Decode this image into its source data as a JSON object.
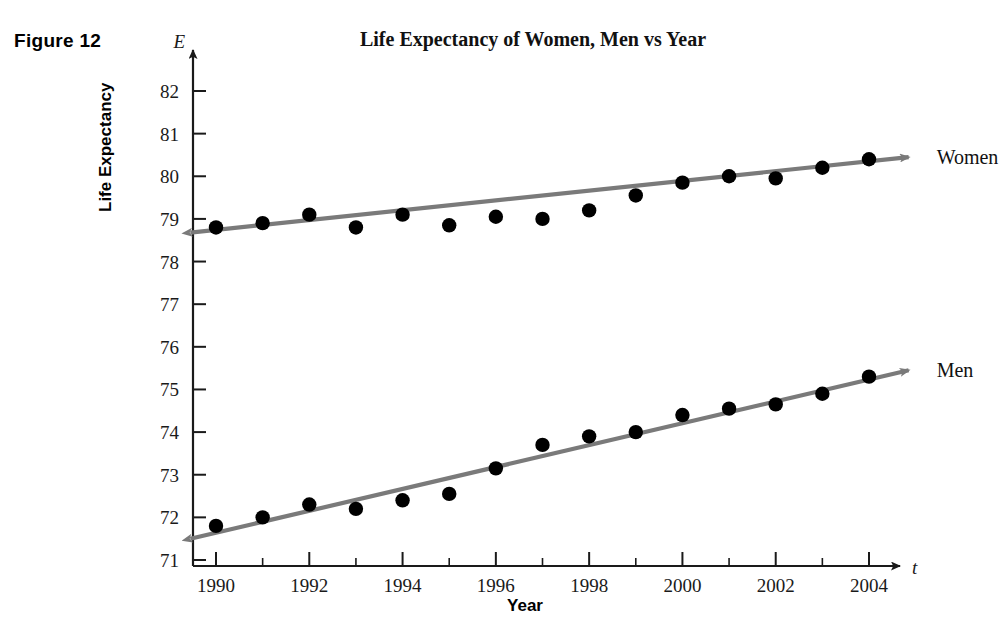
{
  "figure": {
    "caption": "Figure 12"
  },
  "chart_data": {
    "type": "scatter",
    "title": "Life Expectancy of Women, Men vs Year",
    "xlabel": "Year",
    "ylabel": "Life Expectancy",
    "x_axis_variable": "t",
    "y_axis_variable": "E",
    "xlim": [
      1989.3,
      2004.9
    ],
    "ylim": [
      70.75,
      82.4
    ],
    "grid": false,
    "legend_position": "right-of-axes-inline",
    "x_tick_labels": [
      "1990",
      "1992",
      "1994",
      "1996",
      "1998",
      "2000",
      "2002",
      "2004"
    ],
    "x_tick_values": [
      1990,
      1992,
      1994,
      1996,
      1998,
      2000,
      2002,
      2004
    ],
    "x_minor_tick_values": [
      1991,
      1993,
      1995,
      1997,
      1999,
      2001,
      2003
    ],
    "y_tick_labels": [
      "71",
      "72",
      "73",
      "74",
      "75",
      "76",
      "77",
      "78",
      "79",
      "80",
      "81",
      "82"
    ],
    "y_tick_values": [
      71,
      72,
      73,
      74,
      75,
      76,
      77,
      78,
      79,
      80,
      81,
      82
    ],
    "x": [
      1990,
      1991,
      1992,
      1993,
      1994,
      1995,
      1996,
      1997,
      1998,
      1999,
      2000,
      2001,
      2002,
      2003,
      2004
    ],
    "series": [
      {
        "name": "Women",
        "label": "Women",
        "marker": "filled-circle",
        "marker_color": "#000000",
        "trendline_color": "#7a7a7a",
        "values": [
          78.8,
          78.9,
          79.1,
          78.8,
          79.1,
          78.85,
          79.05,
          79.0,
          79.2,
          79.55,
          79.85,
          80.0,
          79.95,
          80.2,
          80.4
        ],
        "trendline": {
          "from": {
            "x": 1989.45,
            "y": 78.68
          },
          "to": {
            "x": 2004.85,
            "y": 80.45
          },
          "arrow_start": true,
          "arrow_end": true
        }
      },
      {
        "name": "Men",
        "label": "Men",
        "marker": "filled-circle",
        "marker_color": "#000000",
        "trendline_color": "#7a7a7a",
        "values": [
          71.8,
          72.0,
          72.3,
          72.2,
          72.4,
          72.55,
          73.15,
          73.7,
          73.9,
          74.0,
          74.4,
          74.55,
          74.65,
          74.9,
          75.3
        ],
        "trendline": {
          "from": {
            "x": 1989.45,
            "y": 71.5
          },
          "to": {
            "x": 2004.85,
            "y": 75.45
          },
          "arrow_start": true,
          "arrow_end": true
        }
      }
    ]
  },
  "colors": {
    "marker": "#000000",
    "trendline": "#7a7a7a",
    "axis": "#1a1a1a",
    "text": "#111111",
    "background": "#ffffff"
  }
}
